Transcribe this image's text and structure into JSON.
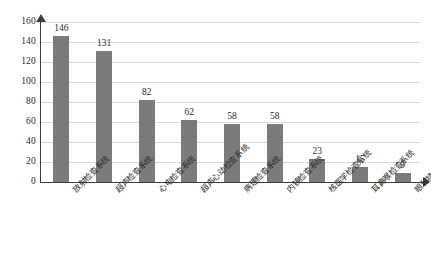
{
  "chart_data": {
    "type": "bar",
    "title": "",
    "xlabel": "",
    "ylabel": "",
    "categories": [
      "放射检查系统",
      "超声检查系统",
      "心电检查系统",
      "超声心动检查系统",
      "病理检查系统",
      "内镜检查系统",
      "核医学检查系统",
      "耳鼻喉检查系统",
      "眼科特检系统"
    ],
    "values": [
      146,
      131,
      82,
      62,
      58,
      58,
      23,
      15,
      9
    ],
    "ylim": [
      0,
      160
    ],
    "yticks": [
      0,
      20,
      40,
      60,
      80,
      100,
      120,
      140,
      160
    ],
    "ytick_labels": [
      "0",
      "20",
      "40",
      "60",
      "80",
      "100",
      "120",
      "140",
      "160"
    ],
    "data_labels": [
      "146",
      "131",
      "82",
      "62",
      "58",
      "58",
      "23",
      "15",
      "9"
    ],
    "grid": true,
    "legend": false,
    "bar_color": "#7b7b7b",
    "grid_color": "#d9d9d9",
    "axis_color": "#3f3f3f",
    "text_color": "#2b2b2b"
  }
}
